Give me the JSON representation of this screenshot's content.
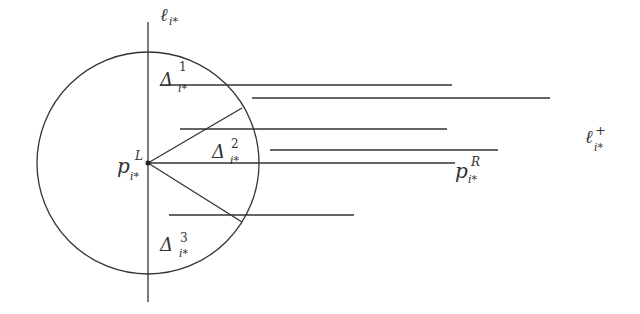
{
  "diagram": {
    "stroke_color": "#333333",
    "background": "#ffffff",
    "vertical_line": {
      "label_base": "ℓ",
      "label_sub": "i*",
      "x": 148,
      "y1": 22,
      "y2": 302
    },
    "circle": {
      "cx": 148,
      "cy": 162,
      "r": 110
    },
    "point_left": {
      "base": "p",
      "sup": "L",
      "sub": "i*",
      "x": 148,
      "y": 162
    },
    "point_right": {
      "base": "p",
      "sup": "R",
      "sub": "i*"
    },
    "line_plus": {
      "base": "ℓ",
      "sup": "+",
      "sub": "i*"
    },
    "regions": [
      {
        "base": "Δ",
        "sup": "1",
        "sub": "i*"
      },
      {
        "base": "Δ",
        "sup": "2",
        "sub": "i*"
      },
      {
        "base": "Δ",
        "sup": "3",
        "sub": "i*"
      }
    ],
    "horizontal_segments": [
      {
        "x1": 160,
        "x2": 452,
        "y": 85
      },
      {
        "x1": 252,
        "x2": 550,
        "y": 98
      },
      {
        "x1": 180,
        "x2": 447,
        "y": 129
      },
      {
        "x1": 270,
        "x2": 498,
        "y": 150
      },
      {
        "x1": 148,
        "x2": 455,
        "y": 163
      },
      {
        "x1": 169,
        "x2": 354,
        "y": 215
      }
    ],
    "rays": [
      {
        "x1": 148,
        "y1": 162,
        "x2": 242,
        "y2": 108
      },
      {
        "x1": 148,
        "y1": 162,
        "x2": 242,
        "y2": 222
      }
    ]
  }
}
